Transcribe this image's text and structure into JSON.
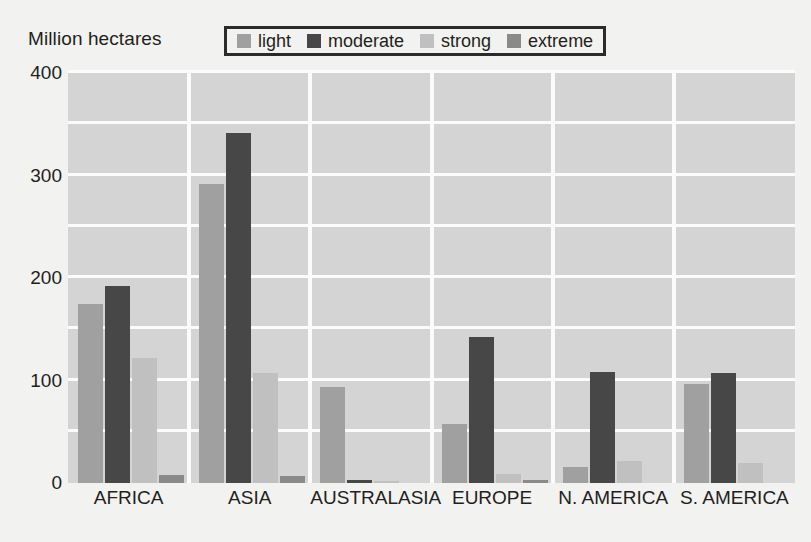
{
  "chart_data": {
    "type": "bar",
    "title": "",
    "ylabel": "Million hectares",
    "xlabel": "",
    "ylim": [
      0,
      400
    ],
    "yticks": [
      0,
      100,
      200,
      300,
      400
    ],
    "ytick_labels": [
      "0",
      "100",
      "200",
      "300",
      "400"
    ],
    "grid": {
      "horizontal": true,
      "vertical": true,
      "minor_step": 50,
      "color": "#fbfbfb"
    },
    "legend": {
      "position": "top-center",
      "bordered": true,
      "entries": [
        {
          "label": "light",
          "color": "#a0a0a0"
        },
        {
          "label": "moderate",
          "color": "#474747"
        },
        {
          "label": "strong",
          "color": "#c0c0c0"
        },
        {
          "label": "extreme",
          "color": "#8a8a8a"
        }
      ]
    },
    "categories": [
      "AFRICA",
      "ASIA",
      "AUSTRALASIA",
      "EUROPE",
      "N. AMERICA",
      "S. AMERICA"
    ],
    "series": [
      {
        "name": "light",
        "color": "#a0a0a0",
        "values": [
          175,
          292,
          94,
          58,
          16,
          97
        ]
      },
      {
        "name": "moderate",
        "color": "#474747",
        "values": [
          192,
          341,
          3,
          142,
          108,
          107
        ]
      },
      {
        "name": "strong",
        "color": "#c0c0c0",
        "values": [
          122,
          107,
          2,
          9,
          21,
          20
        ]
      },
      {
        "name": "extreme",
        "color": "#8a8a8a",
        "values": [
          8,
          7,
          0,
          3,
          0,
          0
        ]
      }
    ],
    "plot_background": "#d4d4d4",
    "page_background": "#f2f2f0"
  }
}
